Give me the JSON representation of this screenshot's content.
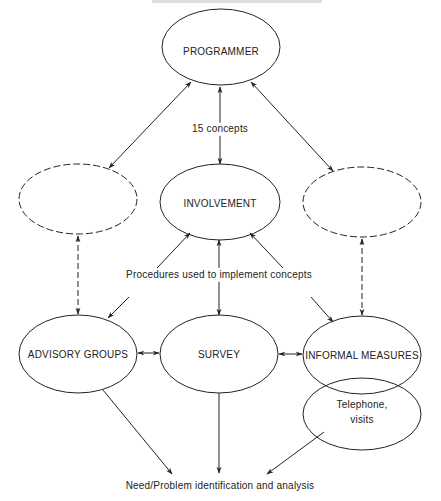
{
  "diagram": {
    "nodes": {
      "programmer": {
        "label": "PROGRAMMER",
        "cx": 221,
        "cy": 47,
        "rx": 59,
        "ry": 38,
        "style": "solid"
      },
      "involvement": {
        "label": "INVOLVEMENT",
        "cx": 220,
        "cy": 202,
        "rx": 60,
        "ry": 38,
        "style": "solid"
      },
      "dashed_left": {
        "label": "",
        "cx": 78,
        "cy": 199,
        "rx": 59,
        "ry": 35,
        "style": "dashed"
      },
      "dashed_right": {
        "label": "",
        "cx": 362,
        "cy": 202,
        "rx": 59,
        "ry": 35,
        "style": "dashed"
      },
      "advisory_groups": {
        "label": "ADVISORY GROUPS",
        "cx": 78,
        "cy": 354,
        "rx": 59,
        "ry": 39,
        "style": "solid"
      },
      "survey": {
        "label": "SURVEY",
        "cx": 219,
        "cy": 354,
        "rx": 59,
        "ry": 39,
        "style": "solid"
      },
      "informal_measures": {
        "label": "INFORMAL MEASURES",
        "cx": 362,
        "cy": 355,
        "rx": 59,
        "ry": 39,
        "style": "solid"
      },
      "telephone_visits": {
        "label_line1": "Telephone,",
        "label_line2": "visits",
        "cx": 362,
        "cy": 414,
        "rx": 59,
        "ry": 36,
        "style": "solid"
      }
    },
    "edge_labels": {
      "concepts": "15 concepts",
      "procedures": "Procedures used to implement concepts",
      "outcome": "Need/Problem identification and analysis"
    },
    "colors": {
      "stroke": "#222222",
      "text": "#222222",
      "background": "#ffffff"
    }
  }
}
